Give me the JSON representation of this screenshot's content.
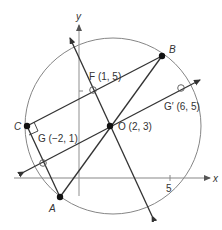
{
  "diagram": {
    "axes": {
      "x_label": "x",
      "y_label": "y",
      "x_tick_label": "5"
    },
    "points": {
      "A": {
        "label": "A"
      },
      "B": {
        "label": "B"
      },
      "C": {
        "label": "C"
      },
      "O": {
        "label": "O (2, 3)"
      },
      "F": {
        "label": "F (1, 5)"
      },
      "G": {
        "label": "G (−2, 1)"
      },
      "G_prime": {
        "label": "G′ (6, 5)"
      }
    },
    "colors": {
      "line": "#333333",
      "axis": "#888888",
      "circle": "#666666",
      "point": "#111111"
    }
  }
}
